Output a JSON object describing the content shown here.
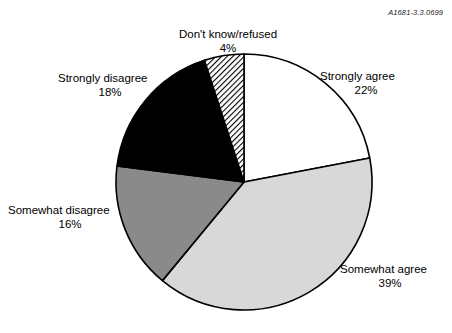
{
  "figure": {
    "reference_code": "A1681-3.3.0699"
  },
  "chart_data": {
    "type": "pie",
    "title": "",
    "xlabel": "",
    "ylabel": "",
    "legend_position": "none",
    "grid": false,
    "units": "percent",
    "start_angle_deg": 0,
    "direction": "clockwise",
    "categories": [
      "Strongly agree",
      "Somewhat agree",
      "Somewhat disagree",
      "Strongly disagree",
      "Don't know/refused"
    ],
    "values": [
      22,
      39,
      16,
      18,
      4
    ],
    "slices": [
      {
        "label": "Strongly agree",
        "value": 22,
        "value_text": "22%",
        "fill": "#ffffff",
        "pattern": "solid",
        "start_deg": 0,
        "end_deg": 79.2
      },
      {
        "label": "Somewhat agree",
        "value": 39,
        "value_text": "39%",
        "fill": "#d8d8d8",
        "pattern": "solid",
        "start_deg": 79.2,
        "end_deg": 219.6
      },
      {
        "label": "Somewhat disagree",
        "value": 16,
        "value_text": "16%",
        "fill": "#8a8a8a",
        "pattern": "solid",
        "start_deg": 219.6,
        "end_deg": 277.2
      },
      {
        "label": "Strongly disagree",
        "value": 18,
        "value_text": "18%",
        "fill": "#000000",
        "pattern": "solid",
        "start_deg": 277.2,
        "end_deg": 342.0
      },
      {
        "label": "Don't know/refused",
        "value": 4,
        "value_text": "4%",
        "fill": "#ffffff",
        "pattern": "diagonal-hatch",
        "start_deg": 342.0,
        "end_deg": 360.0
      }
    ],
    "outline_color": "#000000"
  }
}
